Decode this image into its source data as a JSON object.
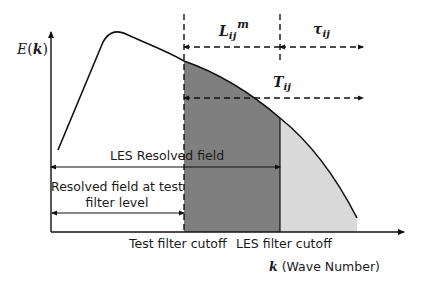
{
  "diagram": {
    "y_axis_label": "E(k)",
    "y_axis_label_var": "E",
    "y_axis_label_arg": "k",
    "x_axis_label_var": "k",
    "x_axis_label_text": "(Wave Number)",
    "cutoffs": {
      "test_filter": "Test filter cutoff",
      "les_filter": "LES filter cutoff"
    },
    "arrows": {
      "les_resolved": "LES Resolved field",
      "resolved_test_line1": "Resolved field at test",
      "resolved_test_line2": "filter level",
      "leonard_stress_base": "L",
      "leonard_stress_sub": "ij",
      "leonard_stress_sup": "m",
      "sgs_stress_base": "τ",
      "sgs_stress_sub": "ij",
      "test_sgs_stress_base": "T",
      "test_sgs_stress_sub": "ij"
    },
    "colors": {
      "dark_region": "#7f7f7f",
      "light_region": "#d9d9d9",
      "line": "#111111"
    }
  }
}
